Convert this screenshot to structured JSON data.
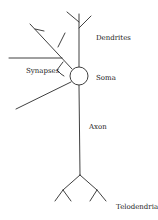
{
  "diagram": {
    "type": "neuron-schematic",
    "labels": {
      "dendrites": "Dendrites",
      "synapses": "Synapses",
      "soma": "Soma",
      "axon": "Axon",
      "telodendria": "Telodendria"
    },
    "colors": {
      "line": "#2a2a2a",
      "text": "#222222",
      "background": "#ffffff"
    }
  }
}
